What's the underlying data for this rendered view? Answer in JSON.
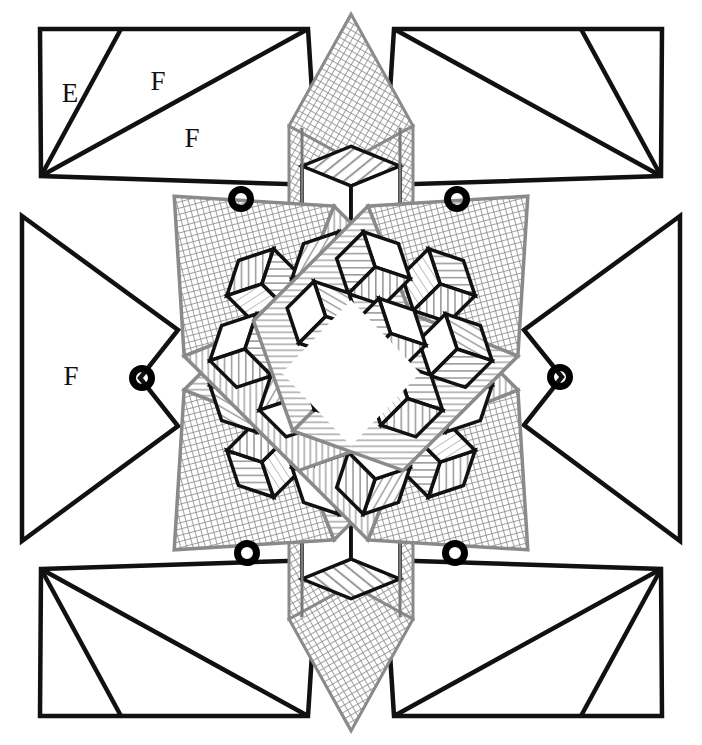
{
  "figure": {
    "kind": "quilt-block-diagram",
    "canvas": {
      "width": 702,
      "height": 745,
      "background": "#ffffff"
    }
  },
  "colors": {
    "outline_dark": "#111111",
    "outline_mid": "#6f6f6f",
    "hatch_gray": "#9a9a9a",
    "marker_black": "#000000",
    "background": "#ffffff",
    "fill_white": "#ffffff"
  },
  "labels": [
    {
      "text": "E",
      "x": 70,
      "y": 96,
      "name": "label-e-top-left"
    },
    {
      "text": "F",
      "x": 158,
      "y": 84,
      "name": "label-f-top-left-upper"
    },
    {
      "text": "F",
      "x": 192,
      "y": 141,
      "name": "label-f-top-left-lower"
    },
    {
      "text": "F",
      "x": 71,
      "y": 379,
      "name": "label-f-left-middle"
    }
  ],
  "markers": {
    "style": "ring",
    "outer_radius": 13,
    "inner_radius": 6,
    "stroke_width": 7,
    "points": [
      {
        "x": 241,
        "y": 199,
        "name": "marker-top-left-inner"
      },
      {
        "x": 457,
        "y": 199,
        "name": "marker-top-right-inner"
      },
      {
        "x": 142,
        "y": 378,
        "name": "marker-left-middle"
      },
      {
        "x": 560,
        "y": 377,
        "name": "marker-right-middle"
      },
      {
        "x": 247,
        "y": 553,
        "name": "marker-bottom-left-inner"
      },
      {
        "x": 455,
        "y": 553,
        "name": "marker-bottom-right-inner"
      }
    ]
  },
  "corner_blocks": {
    "description": "Four outer corner quadrilaterals each divided by two lines into three triangles",
    "items": [
      {
        "name": "corner-block-top-left",
        "points": "40,29 308,29 318,185 41,176",
        "dividers": [
          "41,176 121,29",
          "41,176 308,29"
        ]
      },
      {
        "name": "corner-block-top-right",
        "points": "394,29 662,29 661,176 384,185",
        "dividers": [
          "661,176 581,29",
          "661,176 394,29"
        ]
      },
      {
        "name": "corner-block-bottom-left",
        "points": "41,569 318,560 308,716 40,716",
        "dividers": [
          "41,569 121,716",
          "41,569 308,716"
        ]
      },
      {
        "name": "corner-block-bottom-right",
        "points": "384,560 661,569 662,716 394,716",
        "dividers": [
          "661,569 581,716",
          "661,569 394,716"
        ]
      }
    ]
  },
  "side_triangles": {
    "description": "Four concave chevron side pieces pointing inward at left, right, top-ish and bottom-ish edges",
    "items": [
      {
        "name": "side-triangle-left",
        "points": "22,216 172,333 142,378 172,424 22,541"
      },
      {
        "name": "side-triangle-right",
        "points": "680,216 530,333 560,377 530,424 680,541"
      }
    ]
  },
  "star": {
    "center": {
      "x": 351,
      "y": 373
    },
    "spikes": [
      {
        "name": "spike-top",
        "direction": "up",
        "tip": {
          "x": 351,
          "y": 14
        }
      },
      {
        "name": "spike-bottom",
        "direction": "down",
        "tip": {
          "x": 351,
          "y": 732
        }
      },
      {
        "name": "arm-upper-left",
        "direction": "diagonal"
      },
      {
        "name": "arm-upper-right",
        "direction": "diagonal"
      },
      {
        "name": "arm-lower-left",
        "direction": "diagonal"
      },
      {
        "name": "arm-lower-right",
        "direction": "diagonal"
      }
    ]
  },
  "hatch_patterns": {
    "diagonal_stripe": {
      "name": "hatch-diagonal-stripe",
      "angle_deg": 45,
      "spacing_px": 5
    },
    "diagonal_stripe_alt": {
      "name": "hatch-diagonal-stripe-alt",
      "angle_deg": -45,
      "spacing_px": 5
    },
    "crosshatch": {
      "name": "hatch-crosshatch",
      "spacing_px": 5
    },
    "horizontal_lines": {
      "name": "hatch-horizontal-lines",
      "spacing_px": 5
    },
    "plain": {
      "name": "fill-plain-white"
    }
  },
  "tumbling_blocks": {
    "unit": "rhombus",
    "faces_per_cube": 3,
    "face_names": [
      "top-face",
      "left-face",
      "right-face"
    ],
    "arm_cube_counts": {
      "upper_left": 7,
      "upper_right": 7,
      "lower_left": 7,
      "lower_right": 7
    },
    "spike_cube_counts": {
      "top": 3,
      "bottom": 3
    }
  }
}
